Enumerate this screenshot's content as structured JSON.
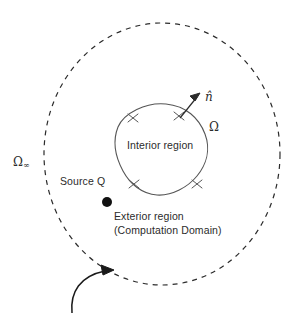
{
  "figure": {
    "background_color": "#ffffff",
    "stroke_color": "#2b2b2b",
    "text_color": "#2b2b2b",
    "width": 303,
    "height": 318
  },
  "labels": {
    "omega_infinity": "Ω",
    "omega_infinity_subscript": "∞",
    "omega": "Ω",
    "normal_vector": "n̂",
    "interior_region": "Interior region",
    "source": "Source Q",
    "exterior_region": "Exterior region",
    "computation_domain": "(Computation Domain)"
  },
  "geometry": {
    "outer_boundary": {
      "name": "far-field-dashed-circle",
      "style": "dashed",
      "center_x": 162,
      "center_y": 154,
      "radius_x": 118,
      "radius_y": 131
    },
    "inner_boundary": {
      "name": "scatterer-blob",
      "style": "solid",
      "tick_marks": 4
    },
    "source_point": {
      "name": "source-dot",
      "x": 107,
      "y": 202,
      "radius": 5
    },
    "normal_arrow": {
      "from_x": 180,
      "from_y": 117,
      "to_x": 200,
      "to_y": 94
    },
    "pointer_arrow": {
      "name": "curved-pointer-to-outer-boundary",
      "tip_x": 110,
      "tip_y": 272
    }
  }
}
